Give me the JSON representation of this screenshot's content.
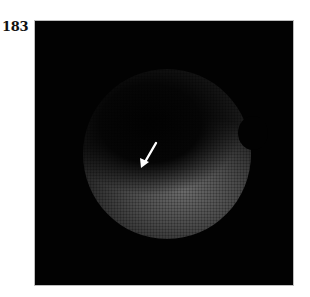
{
  "figure": {
    "panel_label": "183",
    "image": {
      "type": "circular fiberscope/endoscopic view",
      "background_color": "#020202",
      "annotation": {
        "kind": "arrow",
        "color": "#ffffff",
        "direction": "down-left"
      }
    }
  }
}
